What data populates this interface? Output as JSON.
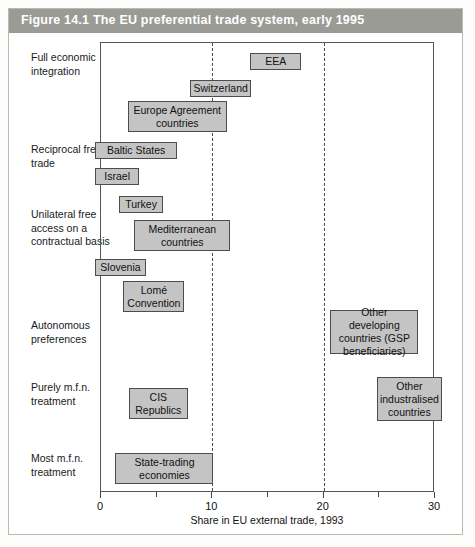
{
  "figure": {
    "number": "Figure 14.1",
    "title": "The EU preferential trade system, early 1995"
  },
  "chart_data": {
    "type": "bar",
    "title": "The EU preferential trade system, early 1995",
    "xlabel": "Share in EU external trade, 1993",
    "ylabel": "",
    "xlim": [
      0,
      30
    ],
    "xticks": [
      0,
      10,
      20,
      30
    ],
    "xtick_labels": [
      "0",
      "10",
      "20",
      "30"
    ],
    "minor_xticks": [
      5,
      15,
      25
    ],
    "gridlines_at": [
      10,
      20
    ],
    "grid": true,
    "legend": "none",
    "categories": [
      "Full economic integration",
      "Reciprocal free trade",
      "Unilateral free access on a contractual basis",
      "Autonomous preferences",
      "Purely m.f.n. treatment",
      "Most m.f.n. treatment"
    ],
    "bars": [
      {
        "label": "EEA",
        "category": "Full economic integration",
        "x_start": 13.4,
        "x_end": 18.0,
        "top": 51,
        "height": 17
      },
      {
        "label": "Switzerland",
        "category": "Full economic integration",
        "x_start": 8.0,
        "x_end": 13.5,
        "top": 78,
        "height": 17
      },
      {
        "label": "Europe Agreement countries",
        "category": "Full economic integration",
        "x_start": 2.4,
        "x_end": 11.3,
        "top": 99,
        "height": 31
      },
      {
        "label": "Baltic States",
        "category": "Reciprocal free trade",
        "x_start": -0.5,
        "x_end": 6.8,
        "top": 140,
        "height": 17
      },
      {
        "label": "Israel",
        "category": "Reciprocal free trade",
        "x_start": -0.5,
        "x_end": 3.4,
        "top": 166,
        "height": 17
      },
      {
        "label": "Turkey",
        "category": "Unilateral free access on a contractual basis",
        "x_start": 1.6,
        "x_end": 5.6,
        "top": 194,
        "height": 17
      },
      {
        "label": "Mediterranean countries",
        "category": "Unilateral free access on a contractual basis",
        "x_start": 3.0,
        "x_end": 11.6,
        "top": 218,
        "height": 31
      },
      {
        "label": "Slovenia",
        "category": "Unilateral free access on a contractual basis",
        "x_start": -0.5,
        "x_end": 4.0,
        "top": 257,
        "height": 17
      },
      {
        "label": "Lomé Convention",
        "category": "Unilateral free access on a contractual basis",
        "x_start": 2.0,
        "x_end": 7.5,
        "top": 279,
        "height": 31
      },
      {
        "label": "Other developing countries (GSP beneficiaries)",
        "category": "Autonomous preferences",
        "x_start": 20.6,
        "x_end": 28.5,
        "top": 308,
        "height": 44
      },
      {
        "label": "CIS Republics",
        "category": "Purely m.f.n. treatment",
        "x_start": 2.5,
        "x_end": 7.8,
        "top": 386,
        "height": 31
      },
      {
        "label": "Other industralised countries",
        "category": "Purely m.f.n. treatment",
        "x_start": 24.8,
        "x_end": 30.6,
        "top": 375,
        "height": 44
      },
      {
        "label": "State-trading economies",
        "category": "Most m.f.n. treatment",
        "x_start": 1.3,
        "x_end": 10.1,
        "top": 451,
        "height": 31
      }
    ]
  },
  "axis": {
    "title": "Share in EU external trade, 1993",
    "ticks": [
      {
        "value": 0,
        "label": "0",
        "major": true
      },
      {
        "value": 5,
        "label": "",
        "major": false
      },
      {
        "value": 10,
        "label": "10",
        "major": true
      },
      {
        "value": 15,
        "label": "",
        "major": false
      },
      {
        "value": 20,
        "label": "20",
        "major": true
      },
      {
        "value": 25,
        "label": "",
        "major": false
      },
      {
        "value": 30,
        "label": "30",
        "major": true
      }
    ]
  },
  "categories": [
    {
      "id": "full-economic-integration",
      "label": "Full economic integration",
      "top": 42
    },
    {
      "id": "reciprocal-free-trade",
      "label": "Reciprocal free trade",
      "top": 134
    },
    {
      "id": "unilateral-free-access",
      "label": "Unilateral free access on a contractual basis",
      "top": 199
    },
    {
      "id": "autonomous-preferences",
      "label": "Autonomous preferences",
      "top": 310
    },
    {
      "id": "purely-mfn-treatment",
      "label": "Purely m.f.n. treatment",
      "top": 372
    },
    {
      "id": "most-mfn-treatment",
      "label": "Most m.f.n. treatment",
      "top": 443
    }
  ],
  "colors": {
    "header_bg": "#9b9b96",
    "header_text": "#ffffff",
    "box_fill": "#c4c4c4",
    "box_border": "#4d4d4d",
    "axis": "#555555",
    "page_bg": "#fdfdfb"
  }
}
